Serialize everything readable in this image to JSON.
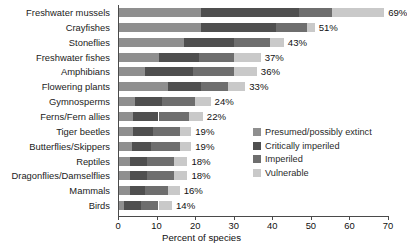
{
  "chart_data": {
    "type": "bar",
    "subtype": "horizontal-stacked-bar",
    "title": "",
    "xlabel": "Percent of species",
    "ylabel": "",
    "xlim": [
      0,
      70
    ],
    "xticks": [
      0,
      10,
      20,
      30,
      40,
      50,
      60,
      70
    ],
    "xtick_labels": [
      "0",
      "10",
      "20",
      "30",
      "40",
      "50",
      "60",
      "70"
    ],
    "grid": false,
    "legend_position": "inside-right-middle",
    "categories": [
      "Freshwater mussels",
      "Crayfishes",
      "Stoneflies",
      "Freshwater fishes",
      "Amphibians",
      "Flowering plants",
      "Gymnosperms",
      "Ferns/Fern allies",
      "Tiger beetles",
      "Butterflies/Skippers",
      "Reptiles",
      "Dragonflies/Damselflies",
      "Mammals",
      "Birds"
    ],
    "totals": [
      69,
      51,
      43,
      37,
      36,
      33,
      24,
      22,
      19,
      19,
      18,
      18,
      16,
      14
    ],
    "total_labels": [
      "69%",
      "51%",
      "43%",
      "37%",
      "36%",
      "33%",
      "24%",
      "22%",
      "19%",
      "19%",
      "18%",
      "18%",
      "16%",
      "14%"
    ],
    "series": [
      {
        "name": "Presumed/possibly extinct",
        "color": "#8f8f8f",
        "values": [
          21.5,
          21.5,
          17.0,
          10.5,
          7.0,
          13.0,
          4.5,
          4.0,
          4.0,
          3.5,
          3.0,
          3.0,
          3.0,
          1.5
        ]
      },
      {
        "name": "Critically imperiled",
        "color": "#4f4f4f",
        "values": [
          25.5,
          19.5,
          13.0,
          10.5,
          12.5,
          8.5,
          7.0,
          6.5,
          5.0,
          5.0,
          4.5,
          4.5,
          4.0,
          4.5
        ]
      },
      {
        "name": "Imperiled",
        "color": "#6e6e6e",
        "values": [
          8.5,
          8.0,
          9.5,
          9.0,
          10.5,
          7.0,
          8.5,
          8.0,
          7.0,
          7.5,
          7.0,
          7.0,
          6.0,
          4.5
        ]
      },
      {
        "name": "Vulnerable",
        "color": "#c9c9c9",
        "values": [
          13.5,
          2.0,
          3.5,
          7.0,
          6.0,
          4.5,
          4.0,
          3.5,
          3.0,
          3.0,
          3.5,
          3.5,
          3.0,
          3.5
        ]
      }
    ]
  },
  "legend": {
    "items": [
      {
        "label": "Presumed/possibly extinct",
        "color": "#8f8f8f"
      },
      {
        "label": "Critically imperiled",
        "color": "#4f4f4f"
      },
      {
        "label": "Imperiled",
        "color": "#6e6e6e"
      },
      {
        "label": "Vulnerable",
        "color": "#c9c9c9"
      }
    ]
  },
  "axis": {
    "x_title": "Percent of species"
  }
}
